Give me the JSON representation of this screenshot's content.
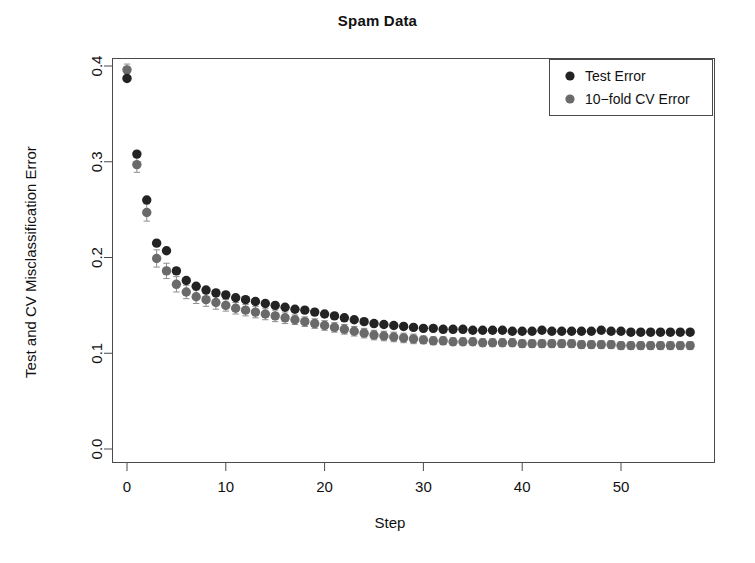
{
  "chart_data": {
    "type": "scatter",
    "title": "Spam Data",
    "xlabel": "Step",
    "ylabel": "Test and CV Misclassification Error",
    "xlim": [
      -1,
      59
    ],
    "ylim": [
      0.0,
      0.42
    ],
    "xticks": [
      0,
      10,
      20,
      30,
      40,
      50
    ],
    "xtick_labels": [
      "0",
      "10",
      "20",
      "30",
      "40",
      "50"
    ],
    "yticks": [
      0.0,
      0.1,
      0.2,
      0.3,
      0.4
    ],
    "ytick_labels": [
      "0.0",
      "0.1",
      "0.2",
      "0.3",
      "0.4"
    ],
    "grid": false,
    "legend_position": "top-right",
    "x": [
      0,
      1,
      2,
      3,
      4,
      5,
      6,
      7,
      8,
      9,
      10,
      11,
      12,
      13,
      14,
      15,
      16,
      17,
      18,
      19,
      20,
      21,
      22,
      23,
      24,
      25,
      26,
      27,
      28,
      29,
      30,
      31,
      32,
      33,
      34,
      35,
      36,
      37,
      38,
      39,
      40,
      41,
      42,
      43,
      44,
      45,
      46,
      47,
      48,
      49,
      50,
      51,
      52,
      53,
      54,
      55,
      56,
      57
    ],
    "series": [
      {
        "name": "Test Error",
        "color": "#232323",
        "marker": "filled-circle",
        "values": [
          0.387,
          0.308,
          0.26,
          0.215,
          0.207,
          0.186,
          0.176,
          0.17,
          0.166,
          0.163,
          0.161,
          0.158,
          0.156,
          0.154,
          0.152,
          0.15,
          0.148,
          0.146,
          0.145,
          0.143,
          0.141,
          0.139,
          0.137,
          0.135,
          0.133,
          0.131,
          0.13,
          0.129,
          0.128,
          0.127,
          0.126,
          0.126,
          0.125,
          0.125,
          0.125,
          0.124,
          0.124,
          0.124,
          0.124,
          0.123,
          0.123,
          0.123,
          0.124,
          0.123,
          0.123,
          0.123,
          0.123,
          0.123,
          0.124,
          0.123,
          0.123,
          0.122,
          0.122,
          0.122,
          0.122,
          0.122,
          0.122,
          0.122
        ]
      },
      {
        "name": "10−fold CV Error",
        "color": "#6a6a6a",
        "marker": "filled-circle",
        "error_bars": true,
        "values": [
          0.396,
          0.297,
          0.247,
          0.199,
          0.186,
          0.172,
          0.164,
          0.159,
          0.156,
          0.153,
          0.15,
          0.147,
          0.145,
          0.143,
          0.141,
          0.139,
          0.137,
          0.135,
          0.133,
          0.131,
          0.129,
          0.127,
          0.125,
          0.123,
          0.121,
          0.119,
          0.118,
          0.117,
          0.116,
          0.115,
          0.114,
          0.113,
          0.113,
          0.112,
          0.112,
          0.112,
          0.111,
          0.111,
          0.111,
          0.111,
          0.11,
          0.11,
          0.11,
          0.11,
          0.11,
          0.11,
          0.109,
          0.109,
          0.109,
          0.109,
          0.108,
          0.108,
          0.108,
          0.108,
          0.108,
          0.108,
          0.108,
          0.108
        ]
      }
    ],
    "error_bar_halfwidths": [
      0.006,
      0.008,
      0.009,
      0.009,
      0.008,
      0.008,
      0.007,
      0.007,
      0.007,
      0.007,
      0.006,
      0.006,
      0.006,
      0.006,
      0.006,
      0.006,
      0.006,
      0.005,
      0.005,
      0.005,
      0.005,
      0.005,
      0.005,
      0.005,
      0.005,
      0.005,
      0.005,
      0.005,
      0.005,
      0.005,
      0.004,
      0.004,
      0.004,
      0.004,
      0.004,
      0.004,
      0.004,
      0.004,
      0.004,
      0.004,
      0.004,
      0.004,
      0.004,
      0.004,
      0.004,
      0.004,
      0.004,
      0.004,
      0.004,
      0.004,
      0.004,
      0.004,
      0.004,
      0.004,
      0.004,
      0.004,
      0.004,
      0.004
    ]
  },
  "legend": {
    "items": [
      {
        "label": "Test Error",
        "color": "#232323"
      },
      {
        "label": "10−fold CV Error",
        "color": "#6a6a6a"
      }
    ]
  },
  "colors": {
    "test_error": "#232323",
    "cv_error": "#6a6a6a",
    "axis": "#4a4a4a",
    "text": "#111111",
    "background": "#ffffff"
  }
}
